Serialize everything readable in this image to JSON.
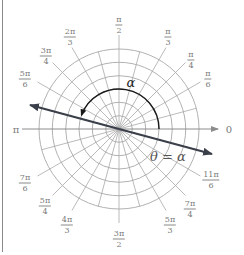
{
  "diagram": {
    "type": "polar-grid",
    "center": [
      119,
      129
    ],
    "circle_radii": [
      13.3,
      26.7,
      40,
      53.3,
      66.7,
      80
    ],
    "spoke_step_deg": 15,
    "colors": {
      "grid": "#a8a8a8",
      "axis": "#8c8c8c",
      "ray": "#3a3f4a",
      "arc": "#1a1a1a",
      "label": "#7a7a7a"
    },
    "angle_labels": [
      {
        "id": "pi-over-2",
        "num": "π",
        "den": "2",
        "x": 119,
        "y": 25
      },
      {
        "id": "pi-over-3",
        "num": "π",
        "den": "3",
        "x": 168,
        "y": 37
      },
      {
        "id": "pi-over-4",
        "num": "π",
        "den": "4",
        "x": 191,
        "y": 60
      },
      {
        "id": "pi-over-6",
        "num": "π",
        "den": "6",
        "x": 208,
        "y": 79
      },
      {
        "id": "2pi-over-3",
        "num": "2π",
        "den": "3",
        "x": 70,
        "y": 37
      },
      {
        "id": "3pi-over-4",
        "num": "3π",
        "den": "4",
        "x": 46,
        "y": 56
      },
      {
        "id": "5pi-over-6",
        "num": "5π",
        "den": "6",
        "x": 25,
        "y": 79
      },
      {
        "id": "7pi-over-6",
        "num": "7π",
        "den": "6",
        "x": 25,
        "y": 183
      },
      {
        "id": "5pi-over-4",
        "num": "5π",
        "den": "4",
        "x": 45,
        "y": 206
      },
      {
        "id": "4pi-over-3",
        "num": "4π",
        "den": "3",
        "x": 67,
        "y": 225
      },
      {
        "id": "3pi-over-2",
        "num": "3π",
        "den": "2",
        "x": 119,
        "y": 239
      },
      {
        "id": "5pi-over-3",
        "num": "5π",
        "den": "3",
        "x": 170,
        "y": 225
      },
      {
        "id": "7pi-over-4",
        "num": "7π",
        "den": "4",
        "x": 190,
        "y": 209
      },
      {
        "id": "11pi-over-6",
        "num": "11π",
        "den": "6",
        "x": 211,
        "y": 180
      }
    ],
    "axis_labels": {
      "pi": {
        "text": "π",
        "x": 16,
        "y": 130
      },
      "zero": {
        "text": "0",
        "x": 229,
        "y": 130
      }
    },
    "alpha_label": {
      "text": "α",
      "x": 131,
      "y": 82
    },
    "ray_label": {
      "text": "θ = α",
      "x": 168,
      "y": 156
    },
    "ray": {
      "from": [
        30,
        105
      ],
      "to": [
        212,
        154
      ]
    },
    "arc": {
      "radius": 40,
      "start_deg": 0,
      "end_deg": 160
    }
  }
}
